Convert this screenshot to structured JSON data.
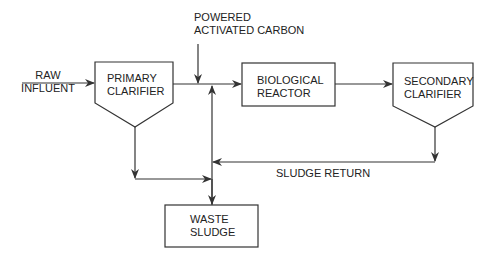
{
  "diagram": {
    "type": "process-flow",
    "nodes": {
      "raw_influent": {
        "line1": "RAW",
        "line2": "INFLUENT"
      },
      "primary_clarifier": {
        "line1": "PRIMARY",
        "line2": "CLARIFIER"
      },
      "powered_activated_carbon": {
        "line1": "POWERED",
        "line2": "ACTIVATED CARBON"
      },
      "biological_reactor": {
        "line1": "BIOLOGICAL",
        "line2": "REACTOR"
      },
      "secondary_clarifier": {
        "line1": "SECONDARY",
        "line2": "CLARIFIER"
      },
      "waste_sludge": {
        "line1": "WASTE",
        "line2": "SLUDGE"
      }
    },
    "edge_labels": {
      "sludge_return": "SLUDGE RETURN"
    },
    "colors": {
      "stroke": "#333333",
      "background": "#ffffff",
      "text": "#222222"
    }
  }
}
